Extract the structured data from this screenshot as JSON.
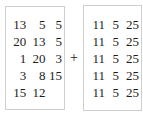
{
  "expression": {
    "operator": "+",
    "operator_name": "plus-sign",
    "left_matrix": {
      "rows": [
        [
          "13",
          "5",
          "5"
        ],
        [
          "20",
          "13",
          "5"
        ],
        [
          "1",
          "20",
          "3"
        ],
        [
          "3",
          "8",
          "15"
        ],
        [
          "15",
          "12",
          ""
        ]
      ]
    },
    "right_matrix": {
      "rows": [
        [
          "11",
          "5",
          "25"
        ],
        [
          "11",
          "5",
          "25"
        ],
        [
          "11",
          "5",
          "25"
        ],
        [
          "11",
          "5",
          "25"
        ],
        [
          "11",
          "5",
          "25"
        ]
      ]
    }
  },
  "colors": {
    "background": "#ffffff",
    "text": "#1c1c1c",
    "border": "#cfcfcf"
  }
}
